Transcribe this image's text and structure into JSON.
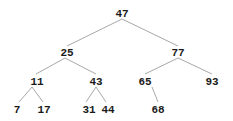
{
  "tree": {
    "nodes": [
      {
        "id": "n47",
        "label": "47",
        "x": 122,
        "y": 13
      },
      {
        "id": "n25",
        "label": "25",
        "x": 67,
        "y": 52
      },
      {
        "id": "n77",
        "label": "77",
        "x": 178,
        "y": 52
      },
      {
        "id": "n11",
        "label": "11",
        "x": 37,
        "y": 81
      },
      {
        "id": "n43",
        "label": "43",
        "x": 96,
        "y": 81
      },
      {
        "id": "n65",
        "label": "65",
        "x": 145,
        "y": 81
      },
      {
        "id": "n93",
        "label": "93",
        "x": 212,
        "y": 81
      },
      {
        "id": "n7",
        "label": "7",
        "x": 17,
        "y": 109
      },
      {
        "id": "n17",
        "label": "17",
        "x": 44,
        "y": 109
      },
      {
        "id": "n31",
        "label": "31",
        "x": 89,
        "y": 109
      },
      {
        "id": "n44",
        "label": "44",
        "x": 108,
        "y": 109
      },
      {
        "id": "n68",
        "label": "68",
        "x": 158,
        "y": 109
      }
    ],
    "edges": [
      {
        "from": [
          122,
          19
        ],
        "to": [
          67,
          46
        ]
      },
      {
        "from": [
          122,
          19
        ],
        "to": [
          178,
          46
        ]
      },
      {
        "from": [
          65,
          58
        ],
        "to": [
          36,
          74
        ]
      },
      {
        "from": [
          65,
          58
        ],
        "to": [
          96,
          74
        ]
      },
      {
        "from": [
          178,
          58
        ],
        "to": [
          145,
          74
        ]
      },
      {
        "from": [
          178,
          58
        ],
        "to": [
          212,
          74
        ]
      },
      {
        "from": [
          32,
          87
        ],
        "to": [
          19,
          102
        ]
      },
      {
        "from": [
          32,
          87
        ],
        "to": [
          43,
          102
        ]
      },
      {
        "from": [
          96,
          87
        ],
        "to": [
          86,
          102
        ]
      },
      {
        "from": [
          96,
          87
        ],
        "to": [
          106,
          102
        ]
      },
      {
        "from": [
          152,
          87
        ],
        "to": [
          158,
          102
        ]
      }
    ]
  }
}
